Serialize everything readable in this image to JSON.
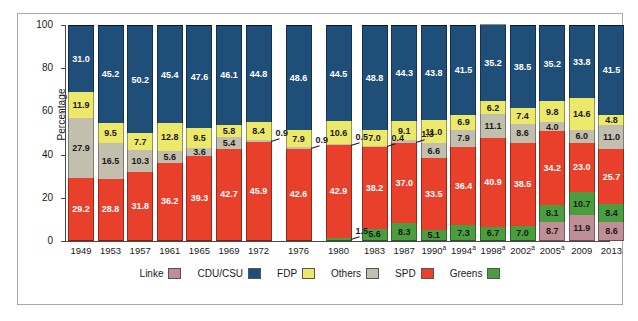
{
  "chart_data": {
    "type": "bar",
    "subtype": "stacked-bar-100",
    "title": "",
    "xlabel": "",
    "ylabel": "Percentage",
    "ylim": [
      0,
      100
    ],
    "yticks": [
      0,
      20,
      40,
      60,
      80,
      100
    ],
    "grid": false,
    "legend_position": "bottom",
    "categories": [
      "1949",
      "1953",
      "1957",
      "1961",
      "1965",
      "1969",
      "1972",
      "1976",
      "1980",
      "1983",
      "1987",
      "1990",
      "1994",
      "1998",
      "2002",
      "2005",
      "2009",
      "2013"
    ],
    "category_labels": [
      "1949",
      "1953",
      "1957",
      "1961",
      "1965",
      "1969",
      "1972",
      "1976",
      "1980",
      "1983",
      "1987",
      "1990a",
      "1994a",
      "1998a",
      "2002a",
      "2005a",
      "2009",
      "2013"
    ],
    "category_footnotes": [
      "",
      "",
      "",
      "",
      "",
      "",
      "",
      "",
      "",
      "",
      "",
      "a",
      "a",
      "a",
      "a",
      "a",
      "",
      ""
    ],
    "stack_order_bottom_to_top": [
      "Linke",
      "Greens",
      "SPD",
      "Others",
      "FDP",
      "CDU/CSU"
    ],
    "series": [
      {
        "name": "Linke",
        "color": "#c08f95",
        "values": [
          null,
          null,
          null,
          null,
          null,
          null,
          null,
          null,
          null,
          null,
          null,
          null,
          null,
          null,
          null,
          8.7,
          11.9,
          8.6
        ]
      },
      {
        "name": "Greens",
        "color": "#4a9e3f",
        "values": [
          null,
          null,
          null,
          null,
          null,
          null,
          null,
          null,
          1.5,
          5.6,
          8.3,
          5.1,
          7.3,
          6.7,
          7.0,
          8.1,
          10.7,
          8.4
        ]
      },
      {
        "name": "SPD",
        "color": "#e8402a",
        "values": [
          29.2,
          28.8,
          31.8,
          36.2,
          39.3,
          42.7,
          45.9,
          42.6,
          42.9,
          38.2,
          37.0,
          33.5,
          36.4,
          40.9,
          38.5,
          34.2,
          23.0,
          25.7
        ]
      },
      {
        "name": "Others",
        "color": "#c3bfae",
        "values": [
          27.9,
          16.5,
          10.3,
          5.6,
          3.6,
          5.4,
          0.9,
          0.9,
          0.5,
          0.4,
          1.3,
          6.6,
          7.9,
          11.1,
          8.6,
          4.0,
          6.0,
          11.0
        ]
      },
      {
        "name": "FDP",
        "color": "#ece96a",
        "values": [
          11.9,
          9.5,
          7.7,
          12.8,
          9.5,
          5.8,
          8.4,
          7.9,
          10.6,
          7.0,
          9.1,
          11.0,
          6.9,
          6.2,
          7.4,
          9.8,
          14.6,
          4.8
        ]
      },
      {
        "name": "CDU/CSU",
        "color": "#1f4e79",
        "values": [
          31.0,
          45.2,
          50.2,
          45.4,
          47.6,
          46.1,
          44.8,
          48.6,
          44.5,
          48.8,
          44.3,
          43.8,
          41.5,
          35.2,
          38.5,
          35.2,
          33.8,
          41.5
        ]
      }
    ],
    "callout_labels": [
      {
        "category": "1972",
        "series": "Others",
        "value": "0.9"
      },
      {
        "category": "1976",
        "series": "Others",
        "value": "0.9"
      },
      {
        "category": "1980",
        "series": "Others",
        "value": "0.5"
      },
      {
        "category": "1980",
        "series": "Greens",
        "value": "1.5"
      },
      {
        "category": "1983",
        "series": "Others",
        "value": "0.4"
      },
      {
        "category": "1987",
        "series": "Others",
        "value": "1.3"
      }
    ]
  },
  "legend": {
    "items": [
      {
        "label": "Linke",
        "color": "#c08f95"
      },
      {
        "label": "CDU/CSU",
        "color": "#1f4e79"
      },
      {
        "label": "FDP",
        "color": "#ece96a"
      },
      {
        "label": "Others",
        "color": "#c3bfae"
      },
      {
        "label": "SPD",
        "color": "#e8402a"
      },
      {
        "label": "Greens",
        "color": "#4a9e3f"
      }
    ]
  },
  "axis": {
    "ylabel": "Percentage",
    "yticks": [
      "0",
      "20",
      "40",
      "60",
      "80",
      "100"
    ]
  }
}
